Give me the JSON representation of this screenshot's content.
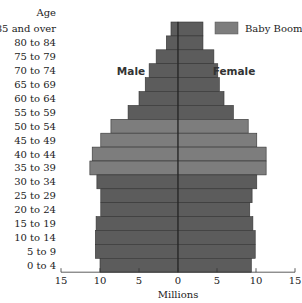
{
  "chart_data": {
    "type": "bar",
    "subtype": "population-pyramid",
    "title": "",
    "ylabel": "Age",
    "xlabel": "Millions",
    "categories": [
      "85 and over",
      "80 to 84",
      "75 to 79",
      "70 to 74",
      "65 to 69",
      "60 to 64",
      "55 to 59",
      "50 to 54",
      "45 to 49",
      "40 to 44",
      "35 to 39",
      "30 to 34",
      "25 to 29",
      "20 to 24",
      "15 to 19",
      "10 to 14",
      "5 to 9",
      "0 to 4"
    ],
    "series": [
      {
        "name": "Male",
        "values": [
          0.9,
          1.5,
          2.8,
          3.7,
          4.2,
          5.0,
          6.4,
          8.6,
          9.9,
          11.0,
          11.3,
          10.4,
          9.9,
          9.9,
          10.5,
          10.6,
          10.6,
          10.0
        ]
      },
      {
        "name": "Female",
        "values": [
          3.2,
          3.2,
          4.6,
          5.1,
          5.3,
          5.9,
          7.1,
          9.0,
          10.1,
          11.3,
          11.3,
          10.1,
          9.5,
          9.2,
          9.6,
          9.9,
          9.9,
          9.4
        ]
      }
    ],
    "highlight": {
      "name": "Baby Boom",
      "categories": [
        "50 to 54",
        "45 to 49",
        "40 to 44",
        "35 to 39"
      ]
    },
    "xlim": [
      -15,
      15
    ],
    "xticks": [
      -15,
      -10,
      -5,
      0,
      5,
      10,
      15
    ],
    "xtick_labels": [
      "15",
      "10",
      "5",
      "0",
      "5",
      "10",
      "15"
    ],
    "legend": {
      "position": "top-right",
      "entries": [
        "Baby Boom"
      ]
    },
    "annotations": {
      "male": "Male",
      "female": "Female"
    },
    "colors": {
      "normal": "#5c5c5c",
      "baby_boom": "#7d7d7d",
      "divider": "#222222",
      "axis": "#333333"
    },
    "grid": false
  }
}
